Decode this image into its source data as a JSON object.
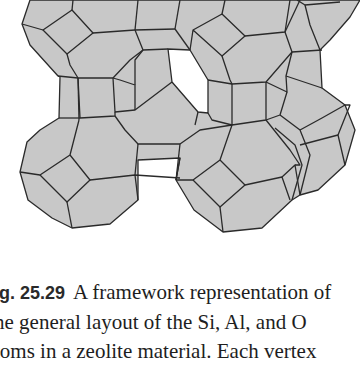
{
  "figure": {
    "colors": {
      "face": "#c8c8c8",
      "edge": "#2a2a2a",
      "hole": "#ffffff"
    }
  },
  "caption": {
    "label": "ig. 25.29",
    "lines": [
      "A framework representation of",
      "he general layout of the Si, Al, and O",
      "toms in a zeolite material. Each vertex"
    ]
  }
}
